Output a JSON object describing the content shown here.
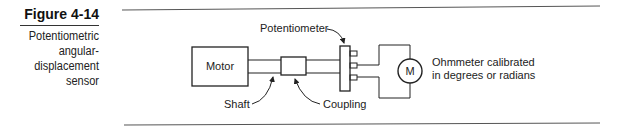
{
  "figure": {
    "number": "Figure 4-14",
    "title_lines": [
      "Potentiometric",
      "angular-",
      "displacement",
      "sensor"
    ]
  },
  "diagram": {
    "labels": {
      "motor": "Motor",
      "potentiometer": "Potentiometer",
      "shaft": "Shaft",
      "coupling": "Coupling",
      "meter_symbol": "M",
      "ohmmeter_line1": "Ohmmeter calibrated",
      "ohmmeter_line2": "in degrees or radians"
    },
    "colors": {
      "line": "#222222",
      "rule": "#555555"
    }
  }
}
